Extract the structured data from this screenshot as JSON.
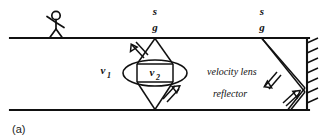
{
  "figure": {
    "panel_tag": "(a)",
    "labels": {
      "source_left": "s",
      "geophone_left": "g",
      "source_right": "s",
      "geophone_right": "g",
      "velocity_outer": "v",
      "velocity_outer_sub": "1",
      "velocity_inner": "v",
      "velocity_inner_sub": "2",
      "velocity_lens": "velocity lens",
      "reflector": "reflector"
    },
    "colors": {
      "ink": "#111111",
      "background": "#ffffff"
    },
    "geometry": {
      "top_surface_y": 38,
      "bottom_surface_y": 110,
      "surface_x_start": 10,
      "surface_x_end": 309,
      "left_sg_x": 155,
      "right_sg_x": 262,
      "reflector_x": 307,
      "lens_center_x": 155,
      "lens_center_y": 73,
      "lens_rx": 32,
      "lens_ry": 13,
      "hatch_count": 7
    }
  }
}
